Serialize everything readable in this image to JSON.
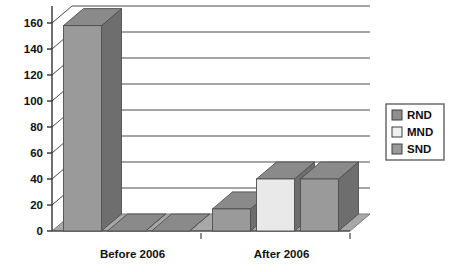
{
  "chart_data": {
    "type": "bar",
    "title": "",
    "subtitle": "",
    "xlabel": "",
    "ylabel": "",
    "categories": [
      "Before 2006",
      "After 2006"
    ],
    "series": [
      {
        "name": "RND",
        "values": [
          158,
          17
        ],
        "color": "#9a9a9a"
      },
      {
        "name": "MND",
        "values": [
          0,
          40
        ],
        "color": "#e9e9e9"
      },
      {
        "name": "SND",
        "values": [
          0,
          40
        ],
        "color": "#9a9a9a"
      }
    ],
    "ylim": [
      0,
      160
    ],
    "ytick_step": 20,
    "yticks": [
      0,
      20,
      40,
      60,
      80,
      100,
      120,
      140,
      160
    ],
    "ytick_labels": [
      "0",
      "20",
      "40",
      "60",
      "80",
      "100",
      "120",
      "140",
      "160"
    ],
    "grid": true,
    "grid_axis": "y",
    "legend_position": "right",
    "three_d": true,
    "annotations": []
  },
  "legend": {
    "entries": [
      {
        "label": "RND",
        "swatch": "#8f8f8f"
      },
      {
        "label": "MND",
        "swatch": "#f0f0f0"
      },
      {
        "label": "SND",
        "swatch": "#9a9a9a"
      }
    ]
  },
  "colors": {
    "background": "#ffffff",
    "axis": "#333333",
    "grid": "#4a4a4a",
    "text": "#111111",
    "bar_front_dark": "#9a9a9a",
    "bar_front_light": "#e9e9e9",
    "bar_side": "#6e6e6e",
    "bar_top": "#8a8a8a",
    "floor": "#a8a8a8",
    "floor_edge": "#7d7d7d",
    "legend_border": "#555555"
  }
}
